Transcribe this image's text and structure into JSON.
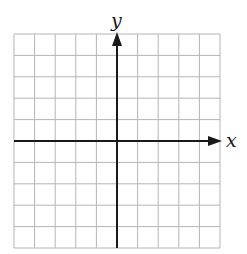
{
  "diagram": {
    "type": "coordinate-plane",
    "x_axis_label": "x",
    "y_axis_label": "y",
    "grid": {
      "columns": 10,
      "rows": 10,
      "left": 14,
      "top": 34,
      "right": 220,
      "bottom": 248
    },
    "origin": {
      "col": 5,
      "row": 5
    },
    "colors": {
      "grid": "#b5b5b5",
      "axis": "#1a1a1a",
      "background": "#ffffff"
    }
  }
}
